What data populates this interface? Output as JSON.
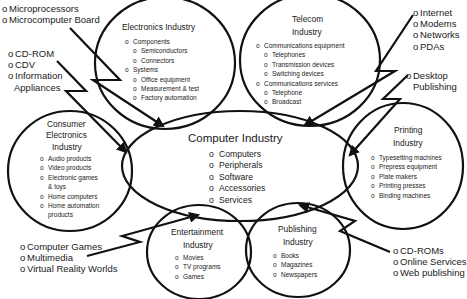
{
  "center": {
    "title": "Computer Industry",
    "items": [
      "Computers",
      "Peripherals",
      "Software",
      "Accessories",
      "Services"
    ]
  },
  "electronics": {
    "title": "Electronics Industry",
    "items": [
      {
        "label": "Components",
        "level": 0
      },
      {
        "label": "Semiconductors",
        "level": 1
      },
      {
        "label": "Connectors",
        "level": 1
      },
      {
        "label": "Systems",
        "level": 0
      },
      {
        "label": "Office equipment",
        "level": 1
      },
      {
        "label": "Measurement & test",
        "level": 1
      },
      {
        "label": "Factory automation",
        "level": 1
      }
    ]
  },
  "telecom": {
    "title_line1": "Telecom",
    "title_line2": "Industry",
    "items": [
      {
        "label": "Communications equipment",
        "level": 0
      },
      {
        "label": "Telephones",
        "level": 1
      },
      {
        "label": "Transmission devices",
        "level": 1
      },
      {
        "label": "Switching devices",
        "level": 1
      },
      {
        "label": "Communications services",
        "level": 0
      },
      {
        "label": "Telephone",
        "level": 1
      },
      {
        "label": "Broadcast",
        "level": 1
      }
    ]
  },
  "consumer": {
    "title_line1": "Consumer",
    "title_line2": "Electronics",
    "title_line3": "Industry",
    "items": [
      "Audio products",
      "Video products",
      "Electronic games",
      "& toys",
      "Home computers",
      "Home automation",
      "products"
    ]
  },
  "printing": {
    "title_line1": "Printing",
    "title_line2": "Industry",
    "items": [
      "Typesetting machines",
      "Prepress equipment",
      "Plate makers",
      "Printing presses",
      "Binding machines"
    ]
  },
  "entertainment": {
    "title_line1": "Entertainment",
    "title_line2": "Industry",
    "items": [
      "Movies",
      "TV programs",
      "Games"
    ]
  },
  "publishing": {
    "title_line1": "Publishing",
    "title_line2": "Industry",
    "items": [
      "Books",
      "Magazines",
      "Newspapers"
    ]
  },
  "external": {
    "micro": [
      "Microprocessors",
      "Microcomputer Board"
    ],
    "cdrom": [
      "CD-ROM",
      "CDV",
      "Information",
      "Appliances"
    ],
    "internet": [
      "Internet",
      "Modems",
      "Networks",
      "PDAs"
    ],
    "desktop": [
      "Desktop",
      "Publishing"
    ],
    "games": [
      "Computer Games",
      "Multimedia",
      "Virtual Reality Worlds"
    ],
    "online": [
      "CD-ROMs",
      "Online Services",
      "Web publishing"
    ]
  },
  "colors": {
    "stroke": "#111111",
    "background": "#ffffff"
  }
}
